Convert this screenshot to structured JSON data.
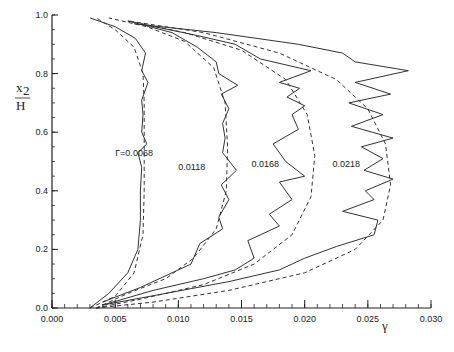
{
  "chart_data": {
    "type": "line",
    "title": "",
    "xlabel": "γ",
    "ylabel_num": "x",
    "ylabel_sub": "2",
    "ylabel_den": "H",
    "xlim": [
      0.0,
      0.03
    ],
    "ylim": [
      0.0,
      1.0
    ],
    "grid": false,
    "legend": "inline curve labels",
    "x_ticks": [
      "0.000",
      "0.005",
      "0.010",
      "0.015",
      "0.020",
      "0.025",
      "0.030"
    ],
    "x_tick_values": [
      0.0,
      0.005,
      0.01,
      0.015,
      0.02,
      0.025,
      0.03
    ],
    "x_minor_step": 0.001,
    "y_ticks": [
      "0.0",
      "0.2",
      "0.4",
      "0.6",
      "0.8",
      "1.0"
    ],
    "y_tick_values": [
      0.0,
      0.2,
      0.4,
      0.6,
      0.8,
      1.0
    ],
    "y_minor_step": 0.05,
    "series": [
      {
        "name": "Γ=0.0068 (solid)",
        "style": "solid",
        "points": [
          [
            0.003,
            0.0
          ],
          [
            0.0045,
            0.05
          ],
          [
            0.006,
            0.12
          ],
          [
            0.0068,
            0.2
          ],
          [
            0.007,
            0.3
          ],
          [
            0.007,
            0.4
          ],
          [
            0.0071,
            0.48
          ],
          [
            0.0068,
            0.53
          ],
          [
            0.0075,
            0.56
          ],
          [
            0.0071,
            0.6
          ],
          [
            0.0072,
            0.66
          ],
          [
            0.0071,
            0.71
          ],
          [
            0.0076,
            0.77
          ],
          [
            0.0071,
            0.81
          ],
          [
            0.0074,
            0.87
          ],
          [
            0.0066,
            0.92
          ],
          [
            0.005,
            0.96
          ],
          [
            0.003,
            0.99
          ]
        ]
      },
      {
        "name": "Γ=0.0068 (dashed)",
        "style": "dashed",
        "points": [
          [
            0.003,
            0.0
          ],
          [
            0.005,
            0.04
          ],
          [
            0.0065,
            0.12
          ],
          [
            0.0072,
            0.25
          ],
          [
            0.0073,
            0.4
          ],
          [
            0.0073,
            0.55
          ],
          [
            0.0073,
            0.7
          ],
          [
            0.0072,
            0.8
          ],
          [
            0.0065,
            0.89
          ],
          [
            0.005,
            0.95
          ],
          [
            0.0035,
            0.99
          ]
        ]
      },
      {
        "name": "0.0118 (solid)",
        "style": "solid",
        "points": [
          [
            0.004,
            0.02
          ],
          [
            0.007,
            0.07
          ],
          [
            0.0095,
            0.12
          ],
          [
            0.011,
            0.15
          ],
          [
            0.0117,
            0.22
          ],
          [
            0.0135,
            0.27
          ],
          [
            0.0132,
            0.31
          ],
          [
            0.014,
            0.37
          ],
          [
            0.0134,
            0.42
          ],
          [
            0.0146,
            0.47
          ],
          [
            0.0135,
            0.53
          ],
          [
            0.0137,
            0.58
          ],
          [
            0.0135,
            0.63
          ],
          [
            0.014,
            0.68
          ],
          [
            0.0134,
            0.73
          ],
          [
            0.0147,
            0.76
          ],
          [
            0.0132,
            0.8
          ],
          [
            0.013,
            0.84
          ],
          [
            0.0115,
            0.89
          ],
          [
            0.0095,
            0.94
          ],
          [
            0.006,
            0.98
          ]
        ]
      },
      {
        "name": "0.0118 (dashed)",
        "style": "dashed",
        "points": [
          [
            0.0035,
            0.0
          ],
          [
            0.006,
            0.05
          ],
          [
            0.009,
            0.1
          ],
          [
            0.0112,
            0.17
          ],
          [
            0.013,
            0.27
          ],
          [
            0.0138,
            0.4
          ],
          [
            0.0139,
            0.55
          ],
          [
            0.0137,
            0.7
          ],
          [
            0.0128,
            0.82
          ],
          [
            0.0105,
            0.91
          ],
          [
            0.0075,
            0.96
          ],
          [
            0.0045,
            0.99
          ]
        ]
      },
      {
        "name": "0.0168 (solid)",
        "style": "solid",
        "points": [
          [
            0.004,
            0.01
          ],
          [
            0.008,
            0.06
          ],
          [
            0.012,
            0.1
          ],
          [
            0.0145,
            0.13
          ],
          [
            0.016,
            0.17
          ],
          [
            0.0155,
            0.23
          ],
          [
            0.018,
            0.28
          ],
          [
            0.0172,
            0.32
          ],
          [
            0.019,
            0.37
          ],
          [
            0.018,
            0.43
          ],
          [
            0.02,
            0.45
          ],
          [
            0.0185,
            0.5
          ],
          [
            0.0175,
            0.56
          ],
          [
            0.0195,
            0.61
          ],
          [
            0.019,
            0.66
          ],
          [
            0.02,
            0.69
          ],
          [
            0.0186,
            0.72
          ],
          [
            0.0196,
            0.75
          ],
          [
            0.018,
            0.77
          ],
          [
            0.0205,
            0.81
          ],
          [
            0.0165,
            0.85
          ],
          [
            0.0145,
            0.9
          ],
          [
            0.0115,
            0.93
          ],
          [
            0.007,
            0.97
          ]
        ]
      },
      {
        "name": "0.0168 (dashed)",
        "style": "dashed",
        "points": [
          [
            0.0035,
            0.0
          ],
          [
            0.007,
            0.03
          ],
          [
            0.012,
            0.08
          ],
          [
            0.016,
            0.15
          ],
          [
            0.019,
            0.25
          ],
          [
            0.0205,
            0.38
          ],
          [
            0.0208,
            0.52
          ],
          [
            0.0202,
            0.66
          ],
          [
            0.0185,
            0.78
          ],
          [
            0.015,
            0.88
          ],
          [
            0.0105,
            0.94
          ],
          [
            0.006,
            0.98
          ]
        ]
      },
      {
        "name": "0.0218 (solid)",
        "style": "solid",
        "points": [
          [
            0.004,
            0.01
          ],
          [
            0.009,
            0.05
          ],
          [
            0.014,
            0.09
          ],
          [
            0.018,
            0.13
          ],
          [
            0.02,
            0.17
          ],
          [
            0.0225,
            0.21
          ],
          [
            0.0255,
            0.25
          ],
          [
            0.0258,
            0.3
          ],
          [
            0.023,
            0.33
          ],
          [
            0.0255,
            0.37
          ],
          [
            0.0248,
            0.4
          ],
          [
            0.027,
            0.44
          ],
          [
            0.0247,
            0.47
          ],
          [
            0.0262,
            0.51
          ],
          [
            0.0245,
            0.55
          ],
          [
            0.027,
            0.58
          ],
          [
            0.0237,
            0.62
          ],
          [
            0.0262,
            0.66
          ],
          [
            0.0235,
            0.7
          ],
          [
            0.0268,
            0.73
          ],
          [
            0.024,
            0.77
          ],
          [
            0.0282,
            0.81
          ],
          [
            0.024,
            0.84
          ],
          [
            0.023,
            0.87
          ],
          [
            0.0195,
            0.9
          ],
          [
            0.013,
            0.94
          ],
          [
            0.0065,
            0.97
          ]
        ]
      },
      {
        "name": "0.0218 (dashed)",
        "style": "dashed",
        "points": [
          [
            0.0035,
            0.0
          ],
          [
            0.008,
            0.02
          ],
          [
            0.014,
            0.06
          ],
          [
            0.02,
            0.12
          ],
          [
            0.024,
            0.2
          ],
          [
            0.0262,
            0.3
          ],
          [
            0.0268,
            0.42
          ],
          [
            0.0264,
            0.56
          ],
          [
            0.025,
            0.68
          ],
          [
            0.0225,
            0.78
          ],
          [
            0.018,
            0.87
          ],
          [
            0.012,
            0.94
          ],
          [
            0.006,
            0.98
          ]
        ]
      }
    ],
    "annotations": [
      {
        "text": "Γ=0.0068",
        "x": 0.005,
        "y": 0.52
      },
      {
        "text": "0.0118",
        "x": 0.01,
        "y": 0.47
      },
      {
        "text": "0.0168",
        "x": 0.0158,
        "y": 0.48
      },
      {
        "text": "0.0218",
        "x": 0.0222,
        "y": 0.48
      }
    ]
  }
}
